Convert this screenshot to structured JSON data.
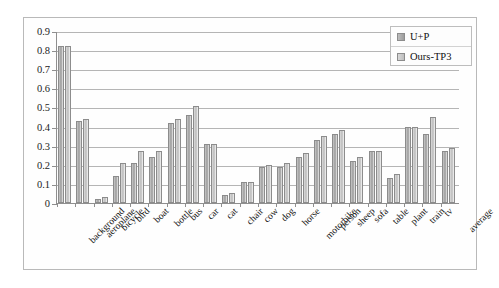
{
  "chart_data": {
    "type": "bar",
    "title": "",
    "xlabel": "",
    "ylabel": "",
    "ylim": [
      0,
      0.9
    ],
    "ytick_labels": [
      "0.9",
      "0.8",
      "0.7",
      "0.6",
      "0.5",
      "0.4",
      "0.3",
      "0.2",
      "0.1",
      "0"
    ],
    "ytick_values": [
      0.9,
      0.8,
      0.7,
      0.6,
      0.5,
      0.4,
      0.3,
      0.2,
      0.1,
      0
    ],
    "grid": true,
    "legend_position": "top-right",
    "categories": [
      "background",
      "aeroplane",
      "bicycle",
      "bird",
      "boat",
      "bottle",
      "bus",
      "car",
      "cat",
      "chair",
      "cow",
      "dog",
      "horse",
      "motorbike",
      "person",
      "sheep",
      "sofa",
      "table",
      "plant",
      "train",
      "tv",
      "average"
    ],
    "series": [
      {
        "name": "U+P",
        "color": "#a0a0a0",
        "values": [
          0.82,
          0.43,
          0.02,
          0.14,
          0.21,
          0.24,
          0.42,
          0.46,
          0.31,
          0.04,
          0.11,
          0.19,
          0.19,
          0.24,
          0.33,
          0.36,
          0.22,
          0.27,
          0.13,
          0.4,
          0.36,
          0.27
        ]
      },
      {
        "name": "Ours-TP3",
        "color": "#c8c8c8",
        "values": [
          0.82,
          0.44,
          0.03,
          0.21,
          0.27,
          0.27,
          0.44,
          0.51,
          0.31,
          0.05,
          0.11,
          0.2,
          0.21,
          0.26,
          0.35,
          0.38,
          0.24,
          0.27,
          0.15,
          0.4,
          0.45,
          0.29
        ]
      }
    ]
  },
  "legend": {
    "items": [
      {
        "label": "U+P"
      },
      {
        "label": "Ours-TP3"
      }
    ]
  }
}
